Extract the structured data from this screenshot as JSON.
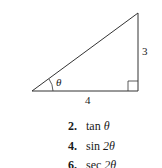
{
  "figure": {
    "type": "right-triangle",
    "angle_label": "θ",
    "side_labels": {
      "opposite": "3",
      "adjacent": "4"
    }
  },
  "exercises": [
    {
      "number": "2.",
      "func": "tan",
      "arg": "θ"
    },
    {
      "number": "4.",
      "func": "sin",
      "arg": "2θ"
    },
    {
      "number": "6.",
      "func": "sec",
      "arg": "2θ"
    }
  ]
}
